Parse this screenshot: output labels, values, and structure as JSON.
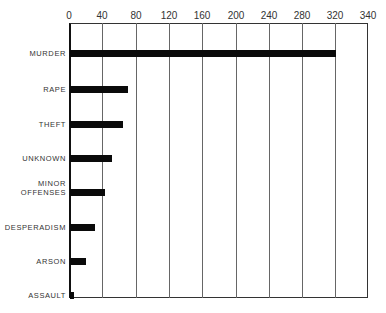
{
  "chart_data": {
    "type": "bar",
    "orientation": "horizontal",
    "title": "",
    "xlabel": "",
    "ylabel": "",
    "x_ticks": [
      "0",
      "40",
      "80",
      "120",
      "160",
      "200",
      "240",
      "280",
      "320",
      "340"
    ],
    "xlim": [
      0,
      340
    ],
    "grid": true,
    "legend": null,
    "categories": [
      "MURDER",
      "RAPE",
      "THEFT",
      "UNKNOWN",
      "MINOR OFFENSES",
      "DESPERADISM",
      "ARSON",
      "ASSAULT"
    ],
    "values": [
      321,
      70,
      64,
      50,
      42,
      30,
      19,
      5
    ]
  },
  "labels": {
    "ticks": [
      "0",
      "40",
      "80",
      "120",
      "160",
      "200",
      "240",
      "280",
      "320",
      "340"
    ],
    "categories": [
      "MURDER",
      "RAPE",
      "THEFT",
      "UNKNOWN",
      "MINOR\nOFFENSES",
      "DESPERADISM",
      "ARSON",
      "ASSAULT"
    ]
  }
}
